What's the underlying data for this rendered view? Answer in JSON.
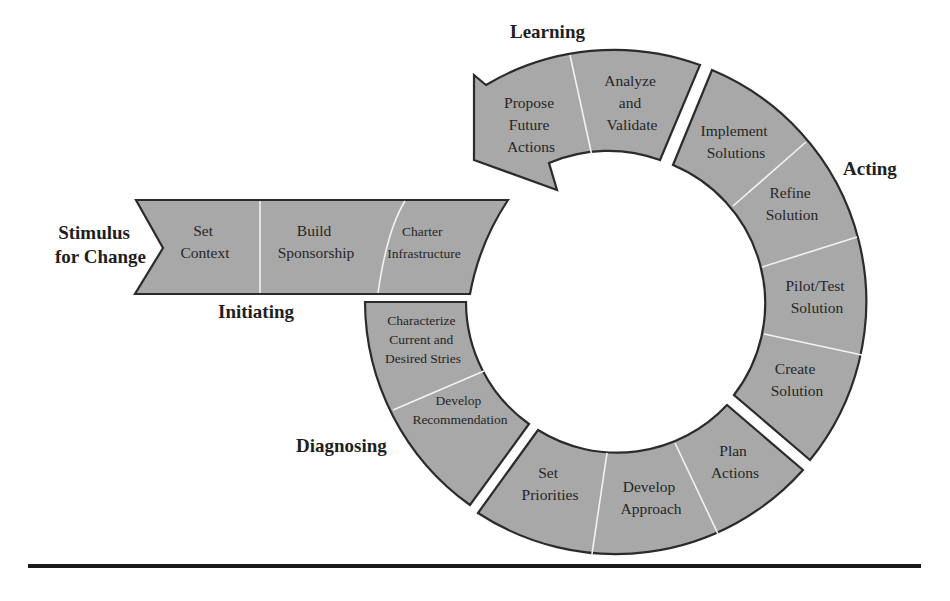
{
  "figure": {
    "type": "change-management-cycle",
    "colors": {
      "segment_fill": "#a8a8a8",
      "segment_stroke": "#2b2b2b",
      "divider": "#f2f2f2",
      "text": "#262626",
      "rule": "#1a1a1a"
    }
  },
  "start_label": {
    "line1": "Stimulus",
    "line2": "for Change"
  },
  "phases": {
    "initiating": {
      "label": "Initiating",
      "steps": [
        {
          "line1": "Set",
          "line2": "Context"
        },
        {
          "line1": "Build",
          "line2": "Sponsorship"
        },
        {
          "line1": "Charter",
          "line2": "Infrastructure"
        }
      ]
    },
    "diagnosing": {
      "label": "Diagnosing",
      "steps": [
        {
          "line1": "Characterize",
          "line2": "Current and",
          "line3": "Desired Stries"
        },
        {
          "line1": "Develop",
          "line2": "Recommendation"
        }
      ]
    },
    "planning": {
      "label": "",
      "steps": [
        {
          "line1": "Set",
          "line2": "Priorities"
        },
        {
          "line1": "Develop",
          "line2": "Approach"
        },
        {
          "line1": "Plan",
          "line2": "Actions"
        }
      ]
    },
    "acting": {
      "label": "Acting",
      "steps": [
        {
          "line1": "Create",
          "line2": "Solution"
        },
        {
          "line1": "Pilot/Test",
          "line2": "Solution"
        },
        {
          "line1": "Refine",
          "line2": "Solution"
        },
        {
          "line1": "Implement",
          "line2": "Solutions"
        }
      ]
    },
    "learning": {
      "label": "Learning",
      "steps": [
        {
          "line1": "Analyze",
          "line2": "and",
          "line3": "Validate"
        },
        {
          "line1": "Propose",
          "line2": "Future",
          "line3": "Actions"
        }
      ]
    }
  }
}
